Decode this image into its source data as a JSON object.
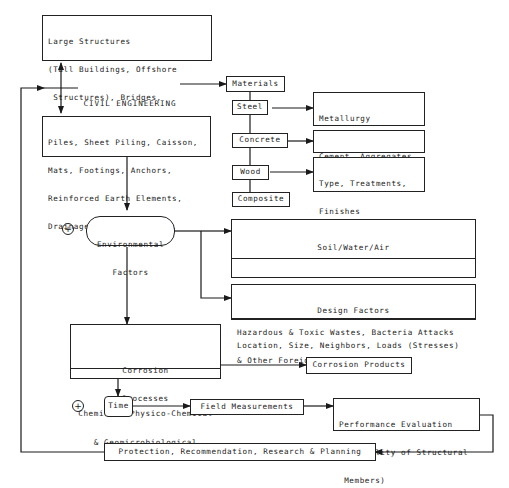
{
  "diagram": {
    "root": {
      "label_line1": "CIVIL ENGINEERING",
      "label_line2": "STRUCTURES"
    },
    "large_structures": {
      "lines": [
        "Large Structures",
        "(Tall Buildings, Offshore",
        " Structures), Bridges,",
        "Highway Pavements & Signs"
      ]
    },
    "foundations": {
      "lines": [
        "Piles, Sheet Piling, Caisson,",
        "Mats, Footings, Anchors,",
        "Reinforced Earth Elements,",
        "Drainage Pipes, Culverts."
      ]
    },
    "materials": {
      "title": "Materials",
      "items": [
        {
          "label": "Steel",
          "details": [
            "Metallurgy",
            "Surface Condition",
            "Composition"
          ]
        },
        {
          "label": "Concrete",
          "details": [
            "Cement, Aggregates,",
            "Curing Time"
          ]
        },
        {
          "label": "Wood",
          "details": [
            "Type, Treatments,",
            "Finishes",
            "Surface Condition"
          ]
        },
        {
          "label": "Composite"
        }
      ]
    },
    "environmental": {
      "line1": "Environmental",
      "line2": "Factors",
      "marker": "+"
    },
    "soil_water_air": {
      "title": "Soil/Water/Air",
      "lines": [
        "Soil Types, Water Types, Heat, Radiation,",
        "Hazardous & Toxic Wastes, Bacteria Attacks",
        "& Other Foreign Agents"
      ]
    },
    "design_factors": {
      "title": "Design Factors",
      "body": "Location, Size, Neighbors, Loads (Stresses)"
    },
    "corrosion": {
      "title_line1": "Corrosion",
      "title_line2": "Processes",
      "body_line1": "Chemical, Physico-Chemical",
      "body_line2": "& Geomicrobiological",
      "products": "Corrosion Products"
    },
    "time": {
      "label": "Time",
      "marker": "+"
    },
    "field_measurements": "Field Measurements",
    "performance": {
      "lines": [
        "Performance Evaluation",
        "(Durability of Structural",
        " Members)"
      ]
    },
    "protection": "Protection, Recommendation, Research & Planning"
  }
}
